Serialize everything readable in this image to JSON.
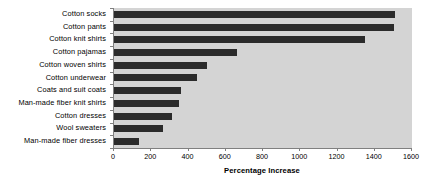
{
  "chart_data": {
    "type": "bar",
    "orientation": "horizontal",
    "title": "",
    "xlabel": "Percentage Increase",
    "ylabel": "",
    "xlim": [
      0,
      1600
    ],
    "xticks": [
      0,
      200,
      400,
      600,
      800,
      1000,
      1200,
      1400,
      1600
    ],
    "xtick_labels": [
      "0",
      "200",
      "400",
      "600",
      "800",
      "1000",
      "1200",
      "1400",
      "1600"
    ],
    "grid": false,
    "legend": null,
    "categories": [
      "Cotton socks",
      "Cotton pants",
      "Cotton knit shirts",
      "Cotton pajamas",
      "Cotton woven shirts",
      "Cotton underwear",
      "Coats and suit coats",
      "Man-made fiber knit shirts",
      "Cotton dresses",
      "Wool sweaters",
      "Man-made fiber dresses"
    ],
    "values": [
      1510,
      1505,
      1350,
      660,
      500,
      445,
      360,
      350,
      310,
      265,
      135
    ],
    "colors": {
      "bar": "#2b2b2b",
      "plot_background": "#d4d4d4",
      "figure_background": "#ffffff",
      "axis": "#808080",
      "text": "#000000"
    }
  }
}
